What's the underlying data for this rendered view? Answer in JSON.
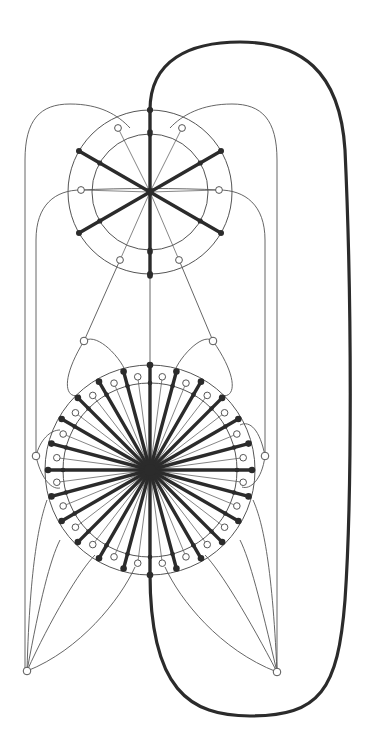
{
  "diagram": {
    "type": "graph-drawing",
    "background": "#ffffff",
    "colors": {
      "thick_edge": "#2b2b2b",
      "thin_edge": "#555555",
      "black_node": "#2b2b2b",
      "white_node_fill": "#ffffff"
    },
    "upper_wheel": {
      "center": [
        150,
        192
      ],
      "outer_radius": 82,
      "inner_radius": 58,
      "thick_spoke_angles_deg": [
        90,
        270,
        30,
        150,
        210,
        330
      ],
      "white_nodes": [
        [
          118,
          128
        ],
        [
          182,
          128
        ],
        [
          81,
          190
        ],
        [
          219,
          190
        ],
        [
          120,
          260
        ],
        [
          179,
          260
        ]
      ]
    },
    "lower_wheel": {
      "center": [
        150,
        470
      ],
      "outer_radius": 105,
      "inner_radius": 87,
      "spoke_count": 24,
      "spoke_length": 102,
      "white_node_radius": 94
    },
    "extra_white_nodes": [
      [
        84,
        341
      ],
      [
        213,
        341
      ],
      [
        36,
        456
      ],
      [
        265,
        456
      ],
      [
        27,
        671
      ],
      [
        277,
        672
      ]
    ],
    "thick_loop_path": "M150,110 C150,60 190,42 240,42 C300,42 340,70 345,150 C352,300 352,500 345,600 C338,690 320,716 250,716 C190,716 150,690 150,573",
    "thin_paths": [
      "M25,671 L25,160 C25,120 40,104 70,104 C100,104 118,115 130,128",
      "M277,672 L277,160 C277,120 262,104 232,104 C202,104 182,115 170,128",
      "M36,456 L36,240 C36,205 55,190 81,190",
      "M265,456 L265,240 C265,205 245,190 219,190",
      "M84,341 L120,260",
      "M213,341 L179,260",
      "M84,341 C60,380 65,400 80,395",
      "M213,341 C240,380 235,400 220,395",
      "M84,341 C100,330 130,370 125,375",
      "M213,341 C200,330 170,370 175,375",
      "M36,456 C40,440 50,430 60,430",
      "M36,456 C40,475 50,490 60,488",
      "M265,456 C260,430 250,420 240,425",
      "M265,456 C262,480 250,490 242,487",
      "M27,671 C40,600 50,560 60,540",
      "M27,671 C50,620 80,570 95,555",
      "M27,671 C80,650 120,600 135,567",
      "M27,671 C30,560 40,520 47,500",
      "M277,672 C260,600 250,560 240,540",
      "M277,672 C250,620 220,570 205,555",
      "M277,672 C220,650 180,600 165,567",
      "M277,672 C272,560 262,520 253,500",
      "M150,192 L150,573"
    ]
  }
}
